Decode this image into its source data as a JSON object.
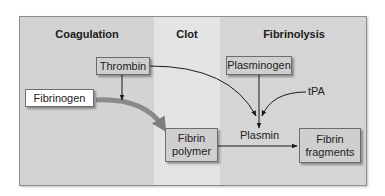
{
  "diagram": {
    "sections": [
      {
        "id": "coagulation",
        "title": "Coagulation"
      },
      {
        "id": "clot",
        "title": "Clot"
      },
      {
        "id": "fibrinolysis",
        "title": "Fibrinolysis"
      }
    ],
    "nodes": {
      "thrombin": "Thrombin",
      "plasminogen": "Plasminogen",
      "fibrinogen": "Fibrinogen",
      "fibrin_polymer_line1": "Fibrin",
      "fibrin_polymer_line2": "polymer",
      "fibrin_fragments_line1": "Fibrin",
      "fibrin_fragments_line2": "fragments"
    },
    "labels": {
      "plasmin": "Plasmin",
      "tpa": "tPA"
    },
    "edges": [
      {
        "from": "Thrombin",
        "to": "Fibrinogen conversion",
        "type": "arrow"
      },
      {
        "from": "Thrombin",
        "to": "Plasmin junction",
        "type": "curved-arrow"
      },
      {
        "from": "Plasminogen",
        "to": "Plasmin",
        "type": "arrow"
      },
      {
        "from": "tPA",
        "to": "Plasmin junction",
        "type": "curved-arrow"
      },
      {
        "from": "Fibrinogen",
        "to": "Fibrin polymer",
        "type": "thick-curved-arrow"
      },
      {
        "from": "Fibrin polymer",
        "to": "Fibrin fragments",
        "type": "arrow",
        "label": "Plasmin"
      }
    ],
    "colors": {
      "coagulation_bg": "#d3d3d3",
      "clot_bg": "#e4e4e4",
      "fibrinolysis_bg": "#d5d5d5",
      "box_fill": "#cfcfcf",
      "box_border": "#6d6d6d",
      "thick_arrow": "#8a8a8a"
    }
  }
}
